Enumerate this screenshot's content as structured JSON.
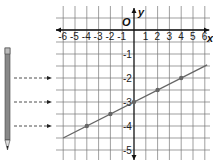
{
  "chart_data": {
    "type": "line",
    "title": "",
    "xlabel": "x",
    "ylabel": "y",
    "origin_label": "O",
    "x_ticks": [
      "-6",
      "-5",
      "-4",
      "-3",
      "-2",
      "-1",
      "1",
      "2",
      "3",
      "4",
      "5",
      "6"
    ],
    "y_ticks": [
      "-1",
      "-2",
      "-3",
      "-4",
      "-5"
    ],
    "xlim": [
      -6,
      6
    ],
    "ylim": [
      -5,
      0
    ],
    "grid": true,
    "equation": "y = (1/4)x - 3",
    "series": [
      {
        "name": "line",
        "x": [
          -4,
          -2,
          0,
          2,
          4
        ],
        "y": [
          -4,
          -3.5,
          -3,
          -2.5,
          -2
        ]
      }
    ]
  },
  "side_illustration": {
    "pencil": "pencil-icon",
    "arrows_at_y": [
      -2,
      -3,
      -4
    ]
  }
}
